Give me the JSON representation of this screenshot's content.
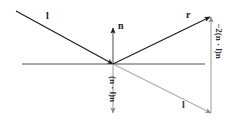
{
  "figure": {
    "background_color": "#ffffff",
    "stroke_dark": "#1a1a1a",
    "stroke_gray": "#8c8c8c",
    "surface_line_color": "#3f3f3f"
  },
  "labels": {
    "incident_top": "l",
    "normal": "n",
    "reflected": "r",
    "incident_copy": "l",
    "projection": "(n · l)n",
    "reflection_term": "−2(n · l)n"
  },
  "geometry": {
    "origin": {
      "x": 113,
      "y": 64
    },
    "surface_line": {
      "x1": 22,
      "y1": 64,
      "x2": 205,
      "y2": 64
    },
    "incident_ray": {
      "x1": 16,
      "y1": 11,
      "x2": 113,
      "y2": 64,
      "arrow": "end"
    },
    "normal_vector": {
      "x1": 113,
      "y1": 64,
      "x2": 113,
      "y2": 28,
      "arrow": "end"
    },
    "reflected_ray": {
      "x1": 113,
      "y1": 64,
      "x2": 210,
      "y2": 17,
      "arrow": "end"
    },
    "projection_vector": {
      "x1": 113,
      "y1": 64,
      "x2": 113,
      "y2": 113,
      "arrow": "end"
    },
    "incident_copy_vector": {
      "x1": 113,
      "y1": 64,
      "x2": 211,
      "y2": 113,
      "arrow": "end"
    },
    "reflection_term_vector": {
      "x1": 211,
      "y1": 113,
      "x2": 211,
      "y2": 17,
      "arrow": "end"
    }
  },
  "label_positions": {
    "incident_top": {
      "x": 46,
      "y": 11
    },
    "normal": {
      "x": 118,
      "y": 21
    },
    "reflected": {
      "x": 186,
      "y": 10
    },
    "incident_copy": {
      "x": 182,
      "y": 100
    },
    "projection": {
      "x": 117,
      "y": 76
    },
    "reflection_term": {
      "x": 223,
      "y": 23
    }
  }
}
